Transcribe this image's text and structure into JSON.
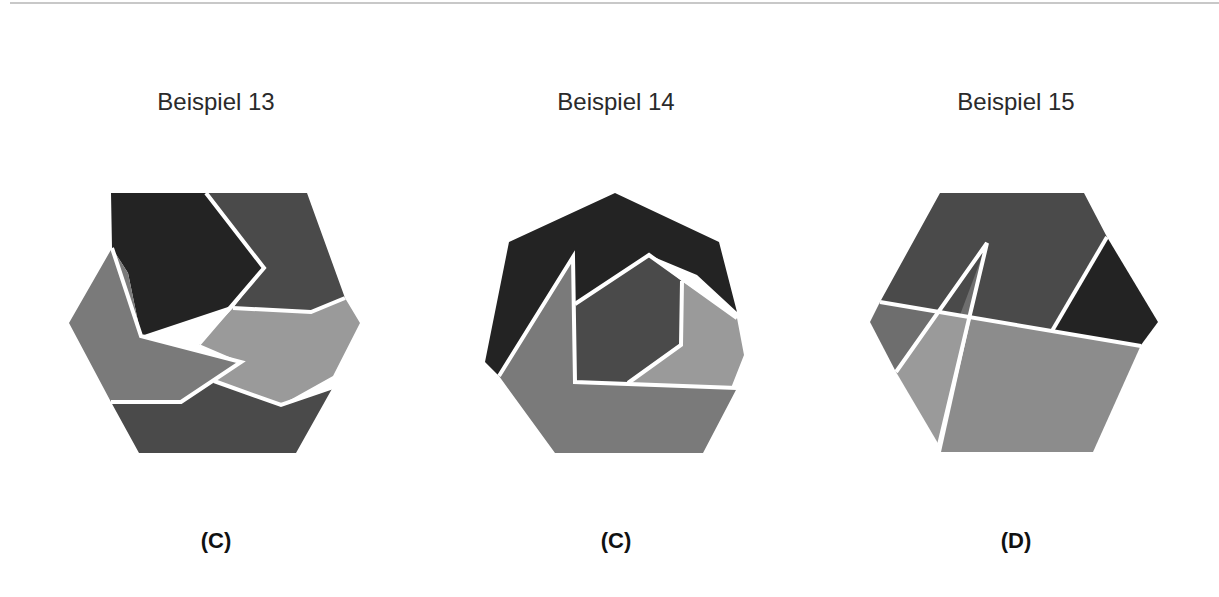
{
  "examples": [
    {
      "title": "Beispiel 13",
      "answer": "(C)",
      "shape": "hexagon"
    },
    {
      "title": "Beispiel 14",
      "answer": "(C)",
      "shape": "heptagon"
    },
    {
      "title": "Beispiel 15",
      "answer": "(D)",
      "shape": "hexagon"
    }
  ],
  "colors": {
    "darkest": "#232323",
    "dark": "#4a4a4a",
    "mid": "#6e6e6e",
    "light": "#8c8c8c",
    "lighter": "#9a9a9a",
    "separator": "#ffffff"
  }
}
